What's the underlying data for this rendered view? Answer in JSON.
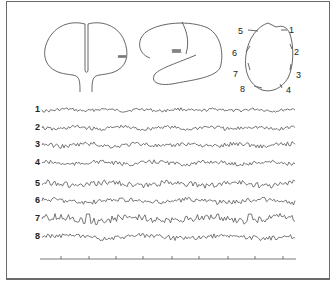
{
  "figure": {
    "brain_views": [
      "coronal-section",
      "lateral-view",
      "top-view-electrode-map"
    ],
    "electrode_map_labels": [
      "1",
      "2",
      "3",
      "4",
      "5",
      "6",
      "7",
      "8"
    ],
    "channels": [
      {
        "label": "1",
        "y": 110
      },
      {
        "label": "2",
        "y": 128
      },
      {
        "label": "3",
        "y": 145
      },
      {
        "label": "4",
        "y": 163
      },
      {
        "label": "5",
        "y": 184
      },
      {
        "label": "6",
        "y": 201
      },
      {
        "label": "7",
        "y": 219
      },
      {
        "label": "8",
        "y": 237
      }
    ],
    "time_axis": {
      "x_start": 40,
      "x_end": 296,
      "y": 258,
      "ticks": [
        61,
        89,
        116,
        143,
        172,
        199,
        228,
        255,
        283
      ]
    },
    "colors": {
      "line": "#555555",
      "border": "#6a6a6a",
      "text": "#222222"
    }
  }
}
